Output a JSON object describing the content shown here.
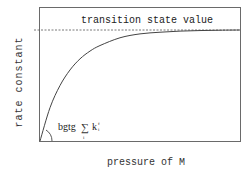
{
  "chart_data": {
    "type": "line",
    "title": "",
    "xlabel": "pressure of M",
    "ylabel": "rate constant",
    "xlim": [
      0,
      1
    ],
    "ylim": [
      0,
      1
    ],
    "grid": false,
    "ticks": {
      "x": [],
      "y": []
    },
    "series": [
      {
        "name": "rate constant vs pressure",
        "style": "solid",
        "description": "saturating curve rising from origin toward the transition state value",
        "x": [
          0,
          0.05,
          0.1,
          0.15,
          0.2,
          0.25,
          0.3,
          0.4,
          0.5,
          0.6,
          0.7,
          0.8,
          0.9,
          1.0
        ],
        "y": [
          0,
          0.3,
          0.5,
          0.64,
          0.74,
          0.81,
          0.86,
          0.93,
          0.965,
          0.98,
          0.99,
          0.995,
          0.998,
          1.0
        ]
      }
    ],
    "asymptote": {
      "label": "transition state value",
      "y": 1.0,
      "style": "dashed"
    },
    "annotations": [
      {
        "name": "initial-slope",
        "text_prefix": "bgtg",
        "sum_symbol": "∑",
        "sum_index": "i",
        "term": "k",
        "term_superscript": "f",
        "term_subscript": "i",
        "description": "angle of initial slope at origin"
      }
    ]
  }
}
